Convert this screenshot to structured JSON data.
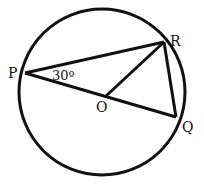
{
  "diagram": {
    "type": "circle-geometry",
    "circle": {
      "cx": 102,
      "cy": 92,
      "r": 83,
      "center_label": "O"
    },
    "points": {
      "P": {
        "x": 25,
        "y": 73,
        "label": "P"
      },
      "R": {
        "x": 164,
        "y": 42,
        "label": "R"
      },
      "Q": {
        "x": 176,
        "y": 117,
        "label": "Q"
      },
      "O": {
        "x": 106,
        "y": 96,
        "label": "O"
      }
    },
    "segments": [
      "P-R",
      "P-Q",
      "O-R",
      "R-Q"
    ],
    "angle_label": "30º",
    "angle_at": "P",
    "stroke_color": "#111111"
  }
}
